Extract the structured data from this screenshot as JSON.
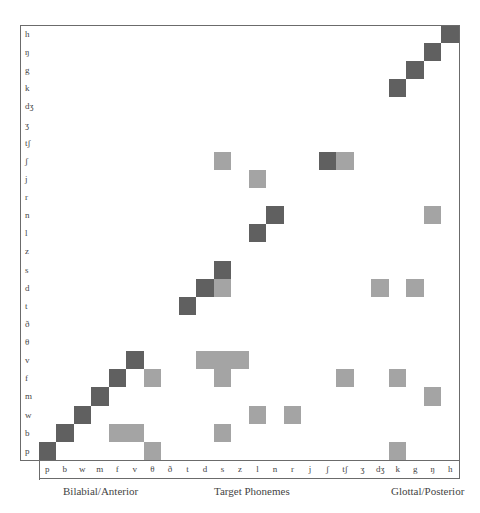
{
  "chart_data": {
    "type": "heatmap",
    "title": "",
    "xlabel": "Target Phonemes",
    "x_axis_annotations": {
      "left": "Bilabial/Anterior",
      "center": "Target Phonemes",
      "right": "Glottal/Posterior"
    },
    "x_categories": [
      "p",
      "b",
      "w",
      "m",
      "f",
      "v",
      "θ",
      "ð",
      "t",
      "d",
      "s",
      "z",
      "l",
      "n",
      "r",
      "j",
      "ʃ",
      "tʃ",
      "ʒ",
      "dʒ",
      "k",
      "g",
      "ŋ",
      "h"
    ],
    "y_categories_top_to_bottom": [
      "h",
      "ŋ",
      "g",
      "k",
      "dʒ",
      "ʒ",
      "tʃ",
      "ʃ",
      "j",
      "r",
      "n",
      "l",
      "z",
      "s",
      "d",
      "t",
      "ð",
      "θ",
      "v",
      "f",
      "m",
      "w",
      "b",
      "p"
    ],
    "levels": {
      "0": "none",
      "1": "light (minor confusion)",
      "2": "dark (primary response)"
    },
    "colors": {
      "none": "#ffffff",
      "light": "#a4a4a4",
      "dark": "#606060",
      "grid": "#6b6b6b"
    },
    "grid": true,
    "cells": [
      {
        "row": "h",
        "col": "h",
        "level": 2
      },
      {
        "row": "ŋ",
        "col": "ŋ",
        "level": 2
      },
      {
        "row": "g",
        "col": "g",
        "level": 2
      },
      {
        "row": "k",
        "col": "k",
        "level": 2
      },
      {
        "row": "ʃ",
        "col": "s",
        "level": 1
      },
      {
        "row": "ʃ",
        "col": "ʃ",
        "level": 2
      },
      {
        "row": "ʃ",
        "col": "tʃ",
        "level": 1
      },
      {
        "row": "j",
        "col": "l",
        "level": 1
      },
      {
        "row": "n",
        "col": "n",
        "level": 2
      },
      {
        "row": "n",
        "col": "ŋ",
        "level": 1
      },
      {
        "row": "l",
        "col": "l",
        "level": 2
      },
      {
        "row": "s",
        "col": "s",
        "level": 2
      },
      {
        "row": "d",
        "col": "d",
        "level": 2
      },
      {
        "row": "d",
        "col": "s",
        "level": 1
      },
      {
        "row": "d",
        "col": "dʒ",
        "level": 1
      },
      {
        "row": "d",
        "col": "g",
        "level": 1
      },
      {
        "row": "t",
        "col": "t",
        "level": 2
      },
      {
        "row": "v",
        "col": "v",
        "level": 2
      },
      {
        "row": "v",
        "col": "d",
        "level": 1
      },
      {
        "row": "v",
        "col": "s",
        "level": 1
      },
      {
        "row": "v",
        "col": "z",
        "level": 1
      },
      {
        "row": "f",
        "col": "f",
        "level": 2
      },
      {
        "row": "f",
        "col": "θ",
        "level": 1
      },
      {
        "row": "f",
        "col": "s",
        "level": 1
      },
      {
        "row": "f",
        "col": "tʃ",
        "level": 1
      },
      {
        "row": "f",
        "col": "k",
        "level": 1
      },
      {
        "row": "m",
        "col": "m",
        "level": 2
      },
      {
        "row": "m",
        "col": "ŋ",
        "level": 1
      },
      {
        "row": "w",
        "col": "w",
        "level": 2
      },
      {
        "row": "w",
        "col": "l",
        "level": 1
      },
      {
        "row": "w",
        "col": "r",
        "level": 1
      },
      {
        "row": "b",
        "col": "b",
        "level": 2
      },
      {
        "row": "b",
        "col": "f",
        "level": 1
      },
      {
        "row": "b",
        "col": "v",
        "level": 1
      },
      {
        "row": "b",
        "col": "s",
        "level": 1
      },
      {
        "row": "p",
        "col": "p",
        "level": 2
      },
      {
        "row": "p",
        "col": "θ",
        "level": 1
      },
      {
        "row": "p",
        "col": "k",
        "level": 1
      }
    ]
  },
  "footer": {
    "left": "Bilabial/Anterior",
    "center": "Target Phonemes",
    "right": "Glottal/Posterior"
  }
}
